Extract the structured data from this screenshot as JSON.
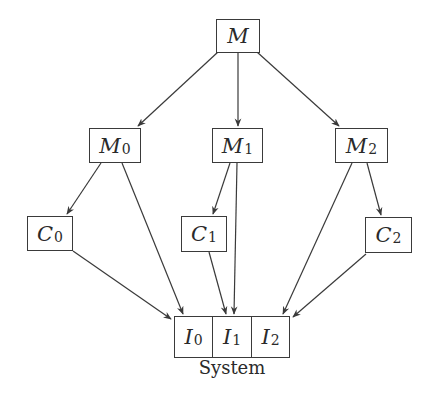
{
  "diagram": {
    "type": "hierarchy",
    "nodes": [
      {
        "id": "M",
        "base": "M",
        "sub": ""
      },
      {
        "id": "M0",
        "base": "M",
        "sub": "0"
      },
      {
        "id": "M1",
        "base": "M",
        "sub": "1"
      },
      {
        "id": "M2",
        "base": "M",
        "sub": "2"
      },
      {
        "id": "C0",
        "base": "C",
        "sub": "0"
      },
      {
        "id": "C1",
        "base": "C",
        "sub": "1"
      },
      {
        "id": "C2",
        "base": "C",
        "sub": "2"
      }
    ],
    "system": {
      "label": "System",
      "cells": [
        {
          "id": "I0",
          "base": "I",
          "sub": "0"
        },
        {
          "id": "I1",
          "base": "I",
          "sub": "1"
        },
        {
          "id": "I2",
          "base": "I",
          "sub": "2"
        }
      ]
    },
    "edges": [
      {
        "from": "M",
        "to": "M0"
      },
      {
        "from": "M",
        "to": "M1"
      },
      {
        "from": "M",
        "to": "M2"
      },
      {
        "from": "M0",
        "to": "C0"
      },
      {
        "from": "M0",
        "to": "I0"
      },
      {
        "from": "M1",
        "to": "C1"
      },
      {
        "from": "M1",
        "to": "I1"
      },
      {
        "from": "M2",
        "to": "C2"
      },
      {
        "from": "M2",
        "to": "I2"
      },
      {
        "from": "C0",
        "to": "I0"
      },
      {
        "from": "C1",
        "to": "I1"
      },
      {
        "from": "C2",
        "to": "I2"
      }
    ],
    "colors": {
      "stroke": "#3a3a3a",
      "text": "#2a2a2a",
      "background": "#ffffff"
    }
  }
}
